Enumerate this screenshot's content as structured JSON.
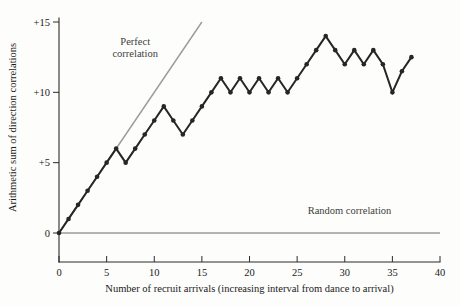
{
  "chart_data": {
    "type": "line",
    "title": "",
    "xlabel": "Number of recruit arrivals (increasing interval from dance to arrival)",
    "ylabel": "Arithmetic sum of direction correlations",
    "xlim": [
      0,
      40
    ],
    "ylim": [
      0,
      15
    ],
    "grid": false,
    "legend_position": "inline-annotations",
    "xticks": [
      0,
      5,
      10,
      15,
      20,
      25,
      30,
      35,
      40
    ],
    "xtick_labels": [
      "0",
      "5",
      "10",
      "15",
      "20",
      "25",
      "30",
      "35",
      "40"
    ],
    "yticks": [
      0,
      5,
      10,
      15
    ],
    "ytick_labels": [
      "0",
      "+5",
      "+10",
      "+15"
    ],
    "series": [
      {
        "name": "Observed cumulative direction correlation",
        "style": "line-with-markers",
        "color": "#262626",
        "x": [
          0,
          1,
          2,
          3,
          4,
          5,
          6,
          7,
          8,
          9,
          10,
          11,
          12,
          13,
          14,
          15,
          16,
          17,
          18,
          19,
          20,
          21,
          22,
          23,
          24,
          25,
          26,
          27,
          28,
          29,
          30,
          31,
          32,
          33,
          34,
          35,
          36,
          37
        ],
        "values": [
          0,
          1,
          2,
          3,
          4,
          5,
          6,
          5,
          6,
          7,
          8,
          9,
          8,
          7,
          8,
          9,
          10,
          11,
          10,
          11,
          10,
          11,
          10,
          11,
          10,
          11,
          12,
          13,
          14,
          13,
          12,
          13,
          12,
          13,
          12,
          10,
          11.5,
          12.5
        ]
      },
      {
        "name": "Perfect correlation",
        "style": "reference-line",
        "color": "#9a9a9a",
        "x": [
          0,
          15
        ],
        "values": [
          0,
          15
        ]
      },
      {
        "name": "Random correlation",
        "style": "reference-line",
        "color": "#9a9a9a",
        "x": [
          0,
          40
        ],
        "values": [
          0,
          0
        ]
      }
    ],
    "annotations": [
      {
        "text_line_1": "Perfect",
        "text_line_2": "correlation",
        "x": 8.0,
        "y": 13.4
      },
      {
        "text_line_1": "Random correlation",
        "text_line_2": "",
        "x": 30.5,
        "y": 1.35
      }
    ]
  }
}
